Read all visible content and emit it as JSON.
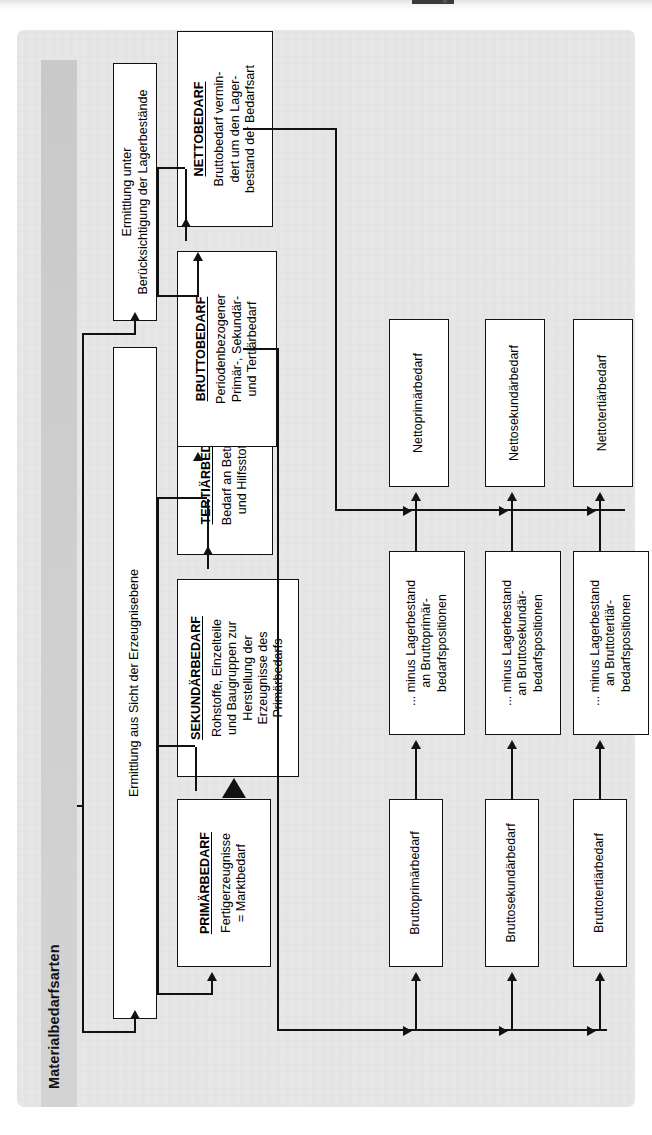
{
  "figure": {
    "title": "Materialbedarfsarten",
    "language": "de"
  },
  "levels": {
    "erzeugnisebene": "Ermittlung aus Sicht der Erzeugnisebene",
    "lagerbestaende": "Ermittlung unter\nBerücksichtigung der Lagerbestände"
  },
  "bedarfsarten": [
    {
      "id": "primaerbedarf",
      "header": "PRIMÄRBEDARF",
      "lines": [
        "Fertigerzeugnisse",
        "= Marktbedarf"
      ]
    },
    {
      "id": "sekundaerbedarf",
      "header": "SEKUNDÄRBEDARF",
      "lines": [
        "Rohstoffe, Einzelteile",
        "und Baugruppen zur",
        "Herstellung der",
        "Erzeugnisse des",
        "Primärbedarfs"
      ]
    },
    {
      "id": "tertiaerbedarf",
      "header": "TERTIÄRBEDARF",
      "lines": [
        "Bedarf an Betriebs-",
        "und Hilfsstoffen"
      ]
    }
  ],
  "lagerarten": [
    {
      "id": "bruttobedarf",
      "header": "BRUTTOBEDARF",
      "lines": [
        "Periodenbezogener",
        "Primär-, Sekundär-",
        "und Tertiärbedarf"
      ]
    },
    {
      "id": "nettobedarf",
      "header": "NETTOBEDARF",
      "lines": [
        "Bruttobedarf vermin-",
        "dert um den Lager-",
        "bestand der Bedarfsart"
      ]
    }
  ],
  "brutto_nodes": [
    {
      "id": "bruttoprimaerbedarf",
      "label": "Bruttoprimärbedarf"
    },
    {
      "id": "bruttosekundaerbedarf",
      "label": "Bruttosekundärbedarf"
    },
    {
      "id": "bruttotertiaerbedarf",
      "label": "Bruttotertiärbedarf"
    }
  ],
  "minus_nodes": [
    {
      "id": "minus-primaer",
      "lines": [
        "... minus Lagerbestand",
        "an Bruttoprimär-",
        "bedarfspositionen"
      ]
    },
    {
      "id": "minus-sekundaer",
      "lines": [
        "... minus Lagerbestand",
        "an Bruttosekundär-",
        "bedarfspositionen"
      ]
    },
    {
      "id": "minus-tertiaer",
      "lines": [
        "... minus Lagerbestand",
        "an Bruttotertiär-",
        "bedarfspositionen"
      ]
    }
  ],
  "netto_nodes": [
    {
      "id": "nettoprimaerbedarf",
      "label": "Nettoprimärbedarf"
    },
    {
      "id": "nettosekundaerbedarf",
      "label": "Nettosekundärbedarf"
    },
    {
      "id": "nettotertiaerbedarf",
      "label": "Nettotertiärbedarf"
    }
  ],
  "colors": {
    "panel": "#e8e8e8",
    "title_band": "#d0d0d0",
    "line": "#111111",
    "node_fill": "#ffffff"
  }
}
